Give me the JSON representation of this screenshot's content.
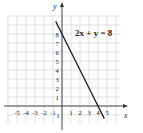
{
  "chart_data": {
    "type": "line",
    "title": "",
    "annotation": "2x + y = 8",
    "xlabel": "x",
    "ylabel": "y",
    "xlim": [
      -6,
      6
    ],
    "ylim": [
      -2,
      10
    ],
    "grid": true,
    "x_tick_labels": [
      "-5",
      "-4",
      "-3",
      "-2",
      "-1",
      "1",
      "2",
      "3",
      "4",
      "5"
    ],
    "y_tick_labels": [
      "1",
      "2",
      "3",
      "4",
      "5",
      "6",
      "7",
      "8"
    ],
    "y_negative_tick_labels": [
      "1"
    ],
    "series": [
      {
        "name": "2x + y = 8",
        "x": [
          -0.7,
          0,
          4,
          4.7
        ],
        "y": [
          9.4,
          8,
          0,
          -1.4
        ],
        "intercepts": {
          "x": 4,
          "y": 8
        }
      }
    ]
  }
}
